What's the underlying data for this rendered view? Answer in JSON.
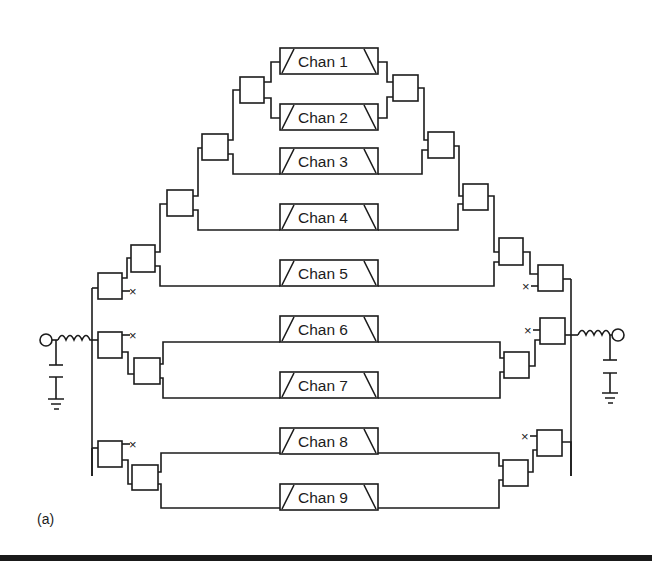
{
  "figure": {
    "caption": "(a)",
    "colors": {
      "line": "#1c1c1c",
      "background": "#ffffff",
      "rule": "#1a1a1a"
    }
  },
  "channels": [
    {
      "label": "Chan 1",
      "y": 33
    },
    {
      "label": "Chan 2",
      "y": 89
    },
    {
      "label": "Chan 3",
      "y": 145
    },
    {
      "label": "Chan 4",
      "y": 201
    },
    {
      "label": "Chan 5",
      "y": 257
    },
    {
      "label": "Chan 6",
      "y": 313
    },
    {
      "label": "Chan 7",
      "y": 369
    },
    {
      "label": "Chan 8",
      "y": 425
    },
    {
      "label": "Chan 9",
      "y": 481
    }
  ],
  "ports": {
    "input": {
      "label": "input-port"
    },
    "output": {
      "label": "output-port"
    }
  }
}
